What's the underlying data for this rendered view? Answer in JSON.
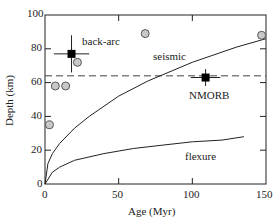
{
  "chart_data": {
    "type": "scatter",
    "title": "",
    "xlabel": "Age (Myr)",
    "ylabel": "Depth (km)",
    "xlim": [
      0,
      150
    ],
    "ylim": [
      0,
      100
    ],
    "xticks": [
      "0",
      "50",
      "100",
      "150"
    ],
    "yticks": [
      "0",
      "20",
      "40",
      "60",
      "80",
      "100"
    ],
    "grid": false,
    "reference_line": {
      "y": 64,
      "style": "dashed"
    },
    "curves": [
      {
        "name": "seismic",
        "x": [
          0,
          2,
          5,
          10,
          20,
          30,
          50,
          70,
          100,
          130,
          150
        ],
        "y": [
          0,
          12,
          18,
          24,
          33,
          40,
          52,
          61,
          72,
          81,
          86
        ]
      },
      {
        "name": "flexure",
        "x": [
          0,
          5,
          10,
          20,
          40,
          60,
          80,
          100,
          120,
          135
        ],
        "y": [
          0,
          7,
          10,
          14,
          18,
          21,
          23,
          25,
          26,
          28
        ]
      }
    ],
    "series": [
      {
        "name": "back-arc",
        "marker": "square",
        "x": [
          18
        ],
        "y": [
          77
        ],
        "xerr": [
          12
        ],
        "yerr": [
          11
        ]
      },
      {
        "name": "NMORB",
        "marker": "square",
        "x": [
          109
        ],
        "y": [
          63
        ],
        "xerr": [
          10
        ],
        "yerr": [
          5
        ]
      },
      {
        "name": "observations",
        "marker": "circle",
        "x": [
          3,
          7,
          14,
          22,
          68,
          147
        ],
        "y": [
          35,
          58,
          58,
          72,
          89,
          88
        ]
      }
    ],
    "annotations": [
      "back-arc",
      "seismic",
      "NMORB",
      "flexure"
    ]
  },
  "labels": {
    "xlabel": "Age (Myr)",
    "ylabel": "Depth (km)",
    "backarc": "back-arc",
    "seismic": "seismic",
    "nmorb": "NMORB",
    "flexure": "flexure",
    "x0": "0",
    "x50": "50",
    "x100": "100",
    "x150": "150",
    "y0": "0",
    "y20": "20",
    "y40": "40",
    "y60": "60",
    "y80": "80",
    "y100": "100"
  }
}
